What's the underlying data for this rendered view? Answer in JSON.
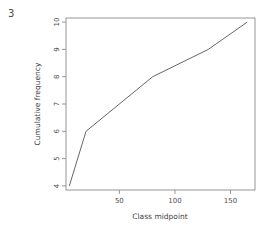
{
  "figure": {
    "corner_number": "3",
    "background_color": "#ffffff",
    "line_color": "#555555",
    "axis_color": "#8a8a8a",
    "text_color": "#4f4f4f"
  },
  "chart_data": {
    "type": "line",
    "title": "",
    "subtitle": "",
    "xlabel": "Class midpoint",
    "ylabel": "Cumulative frequency",
    "x": [
      5,
      20,
      80,
      130,
      165
    ],
    "values": [
      4,
      6,
      8,
      9,
      10
    ],
    "series": [
      {
        "name": "Cumulative frequency",
        "x": [
          5,
          20,
          80,
          130,
          165
        ],
        "values": [
          4,
          6,
          8,
          9,
          10
        ]
      }
    ],
    "xlim": [
      2,
      172
    ],
    "ylim": [
      3.85,
      10.15
    ],
    "xticks": [
      50,
      100,
      150
    ],
    "xtick_labels": [
      "50",
      "100",
      "150"
    ],
    "yticks": [
      4,
      5,
      6,
      7,
      8,
      9,
      10
    ],
    "ytick_labels": [
      "4",
      "5",
      "6",
      "7",
      "8",
      "9",
      "10"
    ],
    "grid": false,
    "legend": false,
    "legend_position": "none",
    "markers": false,
    "ylabel_rotation": 90,
    "ytick_label_rotation": 90
  }
}
